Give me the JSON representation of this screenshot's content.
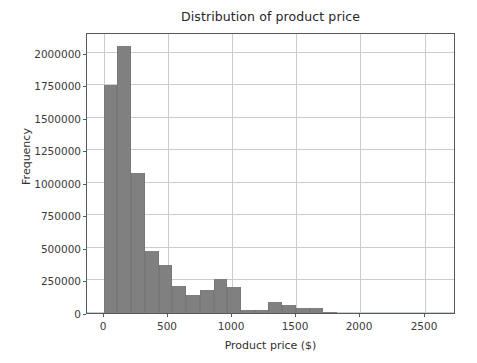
{
  "chart_data": {
    "type": "bar",
    "title": "Distribution of product price",
    "xlabel": "Product price ($)",
    "ylabel": "Frequency",
    "xlim": [
      -130,
      2745
    ],
    "ylim": [
      0,
      2160000
    ],
    "grid": true,
    "legend": null,
    "bar_color": "#808080",
    "bin_width": 107,
    "bin_starts": [
      0,
      107,
      214,
      321,
      428,
      535,
      642,
      749,
      856,
      963,
      1070,
      1177,
      1284,
      1391,
      1498,
      1605,
      1712
    ],
    "values": [
      1756000,
      2055000,
      1074000,
      475000,
      368000,
      210000,
      135000,
      175000,
      260000,
      200000,
      25000,
      25000,
      85000,
      65000,
      35000,
      35000,
      3000
    ],
    "xticks": [
      0,
      500,
      1000,
      1500,
      2000,
      2500
    ],
    "xtick_labels": [
      "0",
      "500",
      "1000",
      "1500",
      "2000",
      "2500"
    ],
    "yticks": [
      0,
      250000,
      500000,
      750000,
      1000000,
      1250000,
      1500000,
      1750000,
      2000000
    ],
    "ytick_labels": [
      "0",
      "250000",
      "500000",
      "750000",
      "1000000",
      "1250000",
      "1500000",
      "1750000",
      "2000000"
    ]
  }
}
